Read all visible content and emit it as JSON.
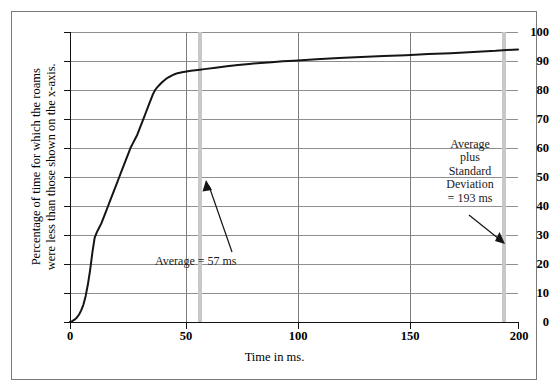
{
  "chart_data": {
    "type": "line",
    "title": "",
    "xlabel": "Time in ms.",
    "ylabel": "Percentage of time for which the roams were less than those shown on the x-axis.",
    "ylabel_line1": "Percentage of time for which the roams",
    "ylabel_line2": "were less than those shown on the x-axis.",
    "xlim": [
      0,
      200
    ],
    "ylim": [
      0,
      100
    ],
    "xticks": [
      0,
      50,
      100,
      150,
      200
    ],
    "yticks": [
      0,
      10,
      20,
      30,
      40,
      50,
      60,
      70,
      80,
      90,
      100
    ],
    "grid": "horizontal-and-vertical",
    "legend": "none",
    "series": [
      {
        "name": "Cumulative roam time distribution",
        "x": [
          0,
          1,
          2,
          3,
          4,
          5,
          6,
          7,
          8,
          9,
          10,
          11,
          12,
          13,
          14,
          15,
          16,
          17,
          18,
          19,
          20,
          21,
          22,
          23,
          24,
          25,
          26,
          27,
          28,
          29,
          30,
          31,
          32,
          33,
          34,
          35,
          36,
          37,
          38,
          39,
          40,
          41,
          42,
          43,
          44,
          45,
          46,
          47,
          48,
          50,
          52,
          54,
          56,
          58,
          60,
          65,
          70,
          75,
          80,
          85,
          90,
          95,
          100,
          110,
          120,
          130,
          140,
          150,
          160,
          170,
          180,
          190,
          195,
          200
        ],
        "y": [
          0,
          0.3,
          0.8,
          1.5,
          2.5,
          4,
          6,
          9,
          13,
          18,
          24,
          29,
          31,
          32.5,
          34,
          36,
          38,
          40,
          42,
          44,
          46,
          48,
          50,
          52,
          54,
          56,
          58,
          60,
          61.5,
          63,
          64.5,
          66.5,
          68.5,
          70.5,
          72.5,
          74.5,
          76.5,
          78.5,
          80,
          81,
          81.8,
          82.6,
          83.3,
          83.9,
          84.4,
          84.8,
          85.2,
          85.5,
          85.8,
          86.1,
          86.4,
          86.6,
          86.8,
          87,
          87.2,
          87.7,
          88.2,
          88.6,
          89,
          89.3,
          89.6,
          89.9,
          90.1,
          90.6,
          91,
          91.4,
          91.7,
          92,
          92.4,
          92.7,
          93.1,
          93.5,
          93.8,
          94
        ]
      }
    ],
    "markers": [
      {
        "name": "average",
        "value": 57,
        "color": "#c8c8c8",
        "label": "Average = 57 ms"
      },
      {
        "name": "average-plus-standard-deviation",
        "value": 193,
        "color": "#c8c8c8",
        "label_lines": [
          "Average",
          "plus",
          "Standard",
          "Deviation",
          "= 193 ms"
        ]
      }
    ]
  },
  "annotations": {
    "average_label": "Average = 57 ms",
    "stddev_line1": "Average",
    "stddev_line2": "plus",
    "stddev_line3": "Standard",
    "stddev_line4": "Deviation",
    "stddev_line5": "= 193 ms"
  },
  "axis": {
    "x_title": "Time in ms.",
    "y_title_line1": "Percentage of time for which the roams",
    "y_title_line2": "were less than those shown on the x-axis.",
    "x_tick_labels": [
      "0",
      "50",
      "100",
      "150",
      "200"
    ],
    "y_tick_labels": [
      "100",
      "90",
      "80",
      "70",
      "60",
      "50",
      "40",
      "30",
      "20",
      "10",
      "0"
    ]
  },
  "colors": {
    "curve": "#151515",
    "gridline": "#8f8f8f",
    "gridline_vertical": "#7d7d7d",
    "marker_band": "#c8c8c8",
    "frame": "#7a7a7a",
    "background": "#ffffff"
  }
}
